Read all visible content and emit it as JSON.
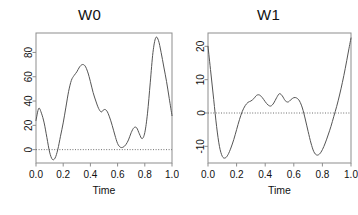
{
  "figure": {
    "background_color": "#ffffff",
    "line_color": "#555555",
    "frame_color": "#8d8d8d",
    "zero_line_color": "#6f6f6f"
  },
  "chart_data": [
    {
      "type": "line",
      "title": "W0",
      "xlabel": "Time",
      "ylabel": "",
      "xlim": [
        0.0,
        1.0
      ],
      "ylim": [
        -11,
        96
      ],
      "grid": false,
      "legend": "none",
      "xticks": [
        "0.0",
        "0.2",
        "0.4",
        "0.6",
        "0.8",
        "1.0"
      ],
      "xtick_values": [
        0.0,
        0.2,
        0.4,
        0.6,
        0.8,
        1.0
      ],
      "yticks": [
        "0",
        "20",
        "40",
        "60",
        "80"
      ],
      "ytick_values": [
        0,
        20,
        40,
        60,
        80
      ],
      "annotations": [
        "dotted horizontal reference line at y = 0"
      ],
      "x": [
        0.0,
        0.02,
        0.04,
        0.06,
        0.08,
        0.1,
        0.12,
        0.14,
        0.16,
        0.18,
        0.2,
        0.22,
        0.24,
        0.26,
        0.28,
        0.3,
        0.32,
        0.34,
        0.36,
        0.38,
        0.4,
        0.42,
        0.44,
        0.46,
        0.48,
        0.5,
        0.52,
        0.54,
        0.56,
        0.58,
        0.6,
        0.62,
        0.64,
        0.66,
        0.68,
        0.7,
        0.72,
        0.74,
        0.76,
        0.78,
        0.8,
        0.82,
        0.84,
        0.86,
        0.88,
        0.9,
        0.92,
        0.94,
        0.96,
        0.98,
        1.0
      ],
      "y": [
        24,
        34,
        30,
        22,
        10,
        -2,
        -8,
        -7,
        0,
        11,
        22,
        35,
        48,
        57,
        61,
        64,
        68,
        70,
        69,
        64,
        56,
        47,
        40,
        34,
        31,
        33,
        32,
        27,
        20,
        12,
        5,
        2,
        2,
        4,
        8,
        14,
        18,
        18,
        13,
        9,
        14,
        30,
        55,
        80,
        92,
        90,
        80,
        68,
        56,
        42,
        28
      ]
    },
    {
      "type": "line",
      "title": "W1",
      "xlabel": "Time",
      "ylabel": "",
      "xlim": [
        0.0,
        1.0
      ],
      "ylim": [
        -15,
        24
      ],
      "grid": false,
      "legend": "none",
      "xticks": [
        "0.0",
        "0.2",
        "0.4",
        "0.6",
        "0.8",
        "1.0"
      ],
      "xtick_values": [
        0.0,
        0.2,
        0.4,
        0.6,
        0.8,
        1.0
      ],
      "yticks": [
        "20",
        "10",
        "0",
        "-10"
      ],
      "ytick_values": [
        20,
        10,
        0,
        -10
      ],
      "annotations": [
        "dotted horizontal reference line at y = 0"
      ],
      "x": [
        0.0,
        0.02,
        0.04,
        0.06,
        0.08,
        0.1,
        0.12,
        0.14,
        0.16,
        0.18,
        0.2,
        0.22,
        0.24,
        0.26,
        0.28,
        0.3,
        0.32,
        0.34,
        0.36,
        0.38,
        0.4,
        0.42,
        0.44,
        0.46,
        0.48,
        0.5,
        0.52,
        0.54,
        0.56,
        0.58,
        0.6,
        0.62,
        0.64,
        0.66,
        0.68,
        0.7,
        0.72,
        0.74,
        0.76,
        0.78,
        0.8,
        0.82,
        0.84,
        0.86,
        0.88,
        0.9,
        0.92,
        0.94,
        0.96,
        0.98,
        1.0
      ],
      "y": [
        20.0,
        12.0,
        4.0,
        -4.0,
        -10.0,
        -13.0,
        -13.5,
        -12.5,
        -10.5,
        -8.0,
        -5.0,
        -2.0,
        0.5,
        2.2,
        3.2,
        3.6,
        4.3,
        5.3,
        5.4,
        4.6,
        3.4,
        2.4,
        2.1,
        3.0,
        4.6,
        5.8,
        5.1,
        3.7,
        3.3,
        4.0,
        4.6,
        4.5,
        3.6,
        1.5,
        -1.8,
        -5.5,
        -9.0,
        -11.6,
        -12.6,
        -12.3,
        -11.0,
        -9.0,
        -6.6,
        -4.0,
        -1.0,
        2.0,
        5.4,
        9.2,
        13.4,
        18.0,
        22.5
      ]
    }
  ]
}
